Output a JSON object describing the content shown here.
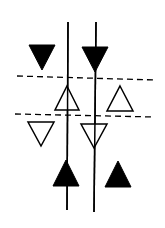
{
  "diagram": {
    "background": "#ffffff",
    "stroke": "#000000",
    "vertical_lines": [
      {
        "id": "line-left",
        "x1": 68,
        "y1": 22,
        "x2": 67,
        "y2": 210
      },
      {
        "id": "line-right",
        "x1": 96,
        "y1": 22,
        "x2": 94,
        "y2": 212
      }
    ],
    "dashed_lines": [
      {
        "id": "dashed-upper",
        "x1": 17,
        "y1": 76,
        "x2": 155,
        "y2": 80
      },
      {
        "id": "dashed-lower",
        "x1": 15,
        "y1": 114,
        "x2": 155,
        "y2": 117
      }
    ],
    "triangles": [
      {
        "id": "filled-down-left",
        "direction": "down",
        "filled": true,
        "cx": 42,
        "top": 45,
        "bottom": 70,
        "half_width": 13
      },
      {
        "id": "filled-down-right",
        "direction": "down",
        "filled": true,
        "cx": 95,
        "top": 47,
        "bottom": 72,
        "half_width": 13
      },
      {
        "id": "open-up-left",
        "direction": "up",
        "filled": false,
        "cx": 67,
        "top": 86,
        "bottom": 110,
        "half_width": 12
      },
      {
        "id": "open-up-right",
        "direction": "up",
        "filled": false,
        "cx": 120,
        "top": 86,
        "bottom": 111,
        "half_width": 13
      },
      {
        "id": "open-down-left",
        "direction": "down",
        "filled": false,
        "cx": 41,
        "top": 122,
        "bottom": 146,
        "half_width": 13
      },
      {
        "id": "open-down-right",
        "direction": "down",
        "filled": false,
        "cx": 94,
        "top": 124,
        "bottom": 148,
        "half_width": 13
      },
      {
        "id": "filled-up-left",
        "direction": "up",
        "filled": true,
        "cx": 66,
        "top": 160,
        "bottom": 186,
        "half_width": 13
      },
      {
        "id": "filled-up-right",
        "direction": "up",
        "filled": true,
        "cx": 118,
        "top": 161,
        "bottom": 187,
        "half_width": 13
      }
    ]
  }
}
